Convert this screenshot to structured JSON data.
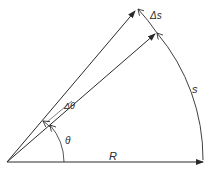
{
  "diagram": {
    "type": "geometry",
    "labels": {
      "radius": "R",
      "arc_length": "s",
      "delta_arc": "Δs",
      "angle": "θ",
      "delta_angle": "Δθ",
      "figure_number_partial": ""
    },
    "colors": {
      "line": "#2a2a2a",
      "background": "#ffffff"
    },
    "geometry": {
      "origin": [
        7,
        162
      ],
      "radius_px": 196,
      "theta_deg": 41,
      "delta_theta_deg": 9
    }
  }
}
